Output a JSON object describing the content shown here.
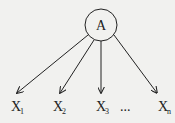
{
  "root_node": {
    "label": "A"
  },
  "child_nodes": [
    {
      "label": "X",
      "subscript": "1"
    },
    {
      "label": "X",
      "subscript": "2"
    },
    {
      "label": "X",
      "subscript": "3"
    },
    {
      "label": "X",
      "subscript": "n"
    }
  ],
  "ellipsis": "...",
  "colors": {
    "stroke": "#222222",
    "background": "#f1f1ef"
  }
}
